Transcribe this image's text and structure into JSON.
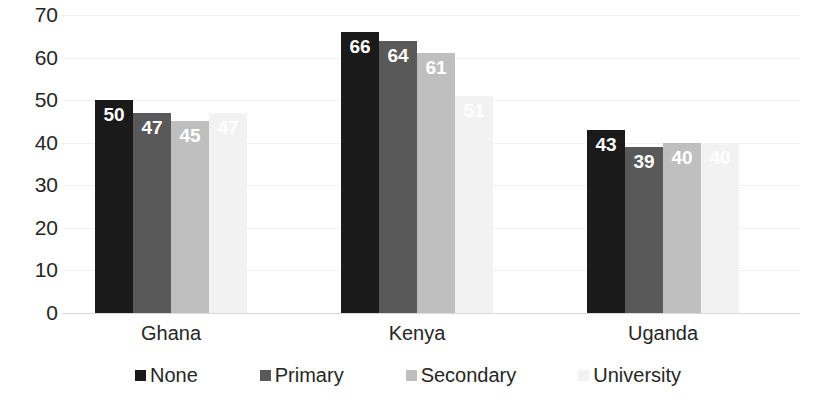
{
  "chart_data": {
    "type": "bar",
    "title": "",
    "subtitle": "",
    "xlabel": "",
    "ylabel": "",
    "ylim": [
      0,
      70
    ],
    "ytick_step": 10,
    "yticks": [
      70,
      60,
      50,
      40,
      30,
      20,
      10,
      0
    ],
    "grid": true,
    "grid_axis": "y",
    "legend_position": "bottom",
    "orientation": "vertical",
    "grouping": "clustered",
    "categories": [
      "Ghana",
      "Kenya",
      "Uganda"
    ],
    "series": [
      {
        "name": "None",
        "color": "#1a1a1a",
        "label_color": "#ffffff",
        "values": [
          50,
          66,
          43
        ]
      },
      {
        "name": "Primary",
        "color": "#595959",
        "label_color": "#ffffff",
        "values": [
          47,
          64,
          39
        ]
      },
      {
        "name": "Secondary",
        "color": "#bfbfbf",
        "label_color": "#ffffff",
        "values": [
          45,
          61,
          40
        ]
      },
      {
        "name": "University",
        "color": "#f2f2f2",
        "label_color": "#ffffff",
        "values": [
          47,
          51,
          40
        ]
      }
    ],
    "data_labels_shown": true,
    "data_labels": {
      "Ghana": [
        "50",
        "47",
        "45",
        "47"
      ],
      "Kenya": [
        "66",
        "64",
        "61",
        "51"
      ],
      "Uganda": [
        "43",
        "39",
        "40",
        "40"
      ]
    }
  },
  "axis": {
    "y_tick_labels": [
      "70",
      "60",
      "50",
      "40",
      "30",
      "20",
      "10",
      "0"
    ],
    "x_tick_labels": [
      "Ghana",
      "Kenya",
      "Uganda"
    ]
  },
  "legend": {
    "items": [
      {
        "label": "None",
        "color": "#1a1a1a"
      },
      {
        "label": "Primary",
        "color": "#595959"
      },
      {
        "label": "Secondary",
        "color": "#bfbfbf"
      },
      {
        "label": "University",
        "color": "#f2f2f2"
      }
    ]
  },
  "colors": {
    "background": "#ffffff",
    "gridline": "#f0f0f0",
    "baseline": "#d9d9d9",
    "text": "#262626",
    "series_none": "#1a1a1a",
    "series_primary": "#595959",
    "series_secondary": "#bfbfbf",
    "series_university": "#f2f2f2"
  }
}
